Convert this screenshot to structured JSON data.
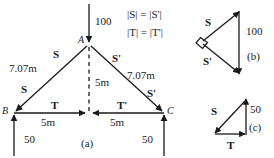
{
  "figure": {
    "title_tags": {
      "panel_a": "(a)",
      "panel_b": "(b)",
      "panel_c": "(c)"
    },
    "equations": {
      "line1_lhs": "|S|",
      "line1_eq": "=",
      "line1_rhs": "|S'|",
      "line2_lhs": "|T|",
      "line2_eq": "=",
      "line2_rhs": "|T'|",
      "line1_full": "|S| = |S'|",
      "line2_full": "|T| = |T'|"
    },
    "main_diagram": {
      "points": {
        "apex": "A",
        "left": "B",
        "right": "C"
      },
      "applied_load": "100",
      "reaction_left": "50",
      "reaction_right": "50",
      "vector_left_upper": "S",
      "vector_left_lower": "S",
      "vector_right_upper": "S'",
      "vector_right_lower": "S'",
      "vector_bottom_left": "T",
      "vector_bottom_right": "T'",
      "length_left_member": "7.07m",
      "length_right_member": "7.07m",
      "height_label": "5m",
      "span_left": "5m",
      "span_right": "5m"
    },
    "panel_b": {
      "vector_upper": "S",
      "vector_lower": "S'",
      "resultant": "100"
    },
    "panel_c": {
      "vector_hypotenuse": "S",
      "vector_base": "T",
      "resultant": "50"
    },
    "colors": {
      "ink": "#1a1a1a",
      "background": "#ffffff"
    }
  }
}
